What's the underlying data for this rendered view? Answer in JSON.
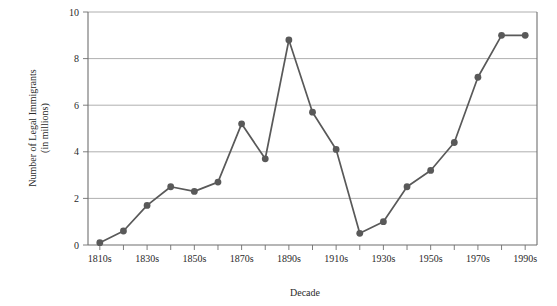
{
  "chart_data": {
    "type": "line",
    "title": "",
    "xlabel": "Decade",
    "ylabel": "Number of Legal Immigrants (in millions)",
    "ylabel_line1": "Number of Legal Immigrants",
    "ylabel_line2": "(in millions)",
    "categories": [
      "1810s",
      "1820s",
      "1830s",
      "1840s",
      "1850s",
      "1860s",
      "1870s",
      "1880s",
      "1890s",
      "1900s",
      "1910s",
      "1920s",
      "1930s",
      "1940s",
      "1950s",
      "1960s",
      "1970s",
      "1980s",
      "1990s"
    ],
    "values": [
      0.1,
      0.6,
      1.7,
      2.5,
      2.3,
      2.7,
      5.2,
      3.7,
      8.8,
      5.7,
      4.1,
      0.5,
      1.0,
      2.5,
      3.2,
      4.4,
      7.2,
      9.0,
      9.0
    ],
    "x_tick_labels": [
      "1810s",
      "1830s",
      "1850s",
      "1870s",
      "1890s",
      "1910s",
      "1930s",
      "1950s",
      "1970s",
      "1990s"
    ],
    "y_tick_labels": [
      "0",
      "2",
      "4",
      "6",
      "8",
      "10"
    ],
    "y_ticks": [
      0,
      2,
      4,
      6,
      8,
      10
    ],
    "ylim": [
      0,
      10
    ],
    "grid": "horizontal",
    "legend": "none",
    "series_color": "#595959",
    "grid_color": "#9a9a9a",
    "axis_color": "#6f6f6f"
  }
}
